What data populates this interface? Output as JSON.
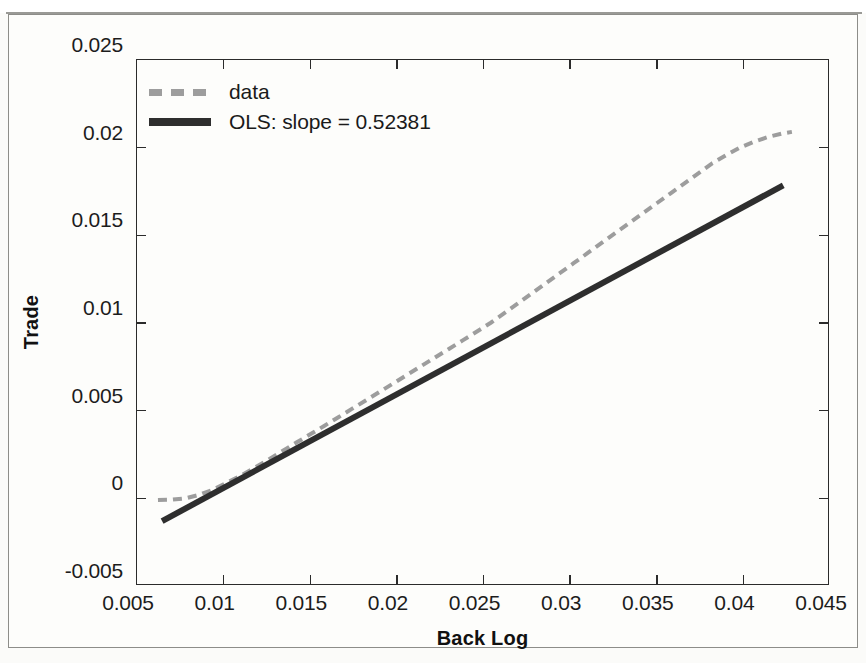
{
  "figure": {
    "background_color": "#fdfdfb",
    "border_color": "#8d8d89"
  },
  "chart_data": {
    "type": "line",
    "title": "",
    "xlabel": "Back Log",
    "ylabel": "Trade",
    "xlim": [
      0.005,
      0.045
    ],
    "ylim": [
      -0.005,
      0.025
    ],
    "xticks": [
      0.005,
      0.01,
      0.015,
      0.02,
      0.025,
      0.03,
      0.035,
      0.04,
      0.045
    ],
    "xtick_labels": [
      "0.005",
      "0.01",
      "0.015",
      "0.02",
      "0.025",
      "0.03",
      "0.035",
      "0.04",
      "0.045"
    ],
    "yticks": [
      -0.005,
      0,
      0.005,
      0.01,
      0.015,
      0.02,
      0.025
    ],
    "ytick_labels": [
      "-0.005",
      "0",
      "0.005",
      "0.01",
      "0.015",
      "0.02",
      "0.025"
    ],
    "grid": false,
    "legend_position": "upper left",
    "series": [
      {
        "name": "data",
        "label": "data",
        "style": "dashed",
        "color": "#9d9d9d",
        "linewidth": 4,
        "x": [
          0.00621,
          0.007,
          0.0078,
          0.0086,
          0.0094,
          0.0102,
          0.011,
          0.0118,
          0.0126,
          0.0134,
          0.0142,
          0.015,
          0.0158,
          0.0166,
          0.0174,
          0.0182,
          0.019,
          0.0198,
          0.0206,
          0.0214,
          0.0222,
          0.023,
          0.0238,
          0.0246,
          0.0254,
          0.0262,
          0.027,
          0.0278,
          0.0286,
          0.0294,
          0.0302,
          0.031,
          0.0318,
          0.0326,
          0.0334,
          0.0342,
          0.035,
          0.0358,
          0.0366,
          0.0374,
          0.0382,
          0.039,
          0.0398,
          0.0406,
          0.0414,
          0.0422,
          0.0428
        ],
        "y": [
          -0.0001,
          -8e-05,
          0.0,
          0.0002,
          0.0005,
          0.0009,
          0.0013,
          0.00175,
          0.00222,
          0.0027,
          0.00318,
          0.00365,
          0.00413,
          0.00461,
          0.0051,
          0.00558,
          0.00607,
          0.00656,
          0.00705,
          0.00754,
          0.00803,
          0.00852,
          0.00901,
          0.0095,
          0.01,
          0.01056,
          0.01113,
          0.0117,
          0.01227,
          0.01284,
          0.01341,
          0.01398,
          0.01455,
          0.01512,
          0.01569,
          0.01626,
          0.01683,
          0.0174,
          0.01797,
          0.01854,
          0.01911,
          0.01957,
          0.02,
          0.02033,
          0.0206,
          0.0208,
          0.0209
        ]
      },
      {
        "name": "ols",
        "label": "OLS: slope = 0.52381",
        "style": "solid",
        "color": "#2e2e2e",
        "linewidth": 6,
        "slope": 0.52381,
        "x": [
          0.00645,
          0.0423
        ],
        "y": [
          -0.0013,
          0.01785
        ]
      }
    ]
  },
  "legend": {
    "items": [
      {
        "label": "data",
        "style": "dashed",
        "color": "#9d9d9d"
      },
      {
        "label": "OLS: slope = 0.52381",
        "style": "solid",
        "color": "#2e2e2e"
      }
    ]
  },
  "axes": {
    "x_title": "Back Log",
    "y_title": "Trade"
  }
}
